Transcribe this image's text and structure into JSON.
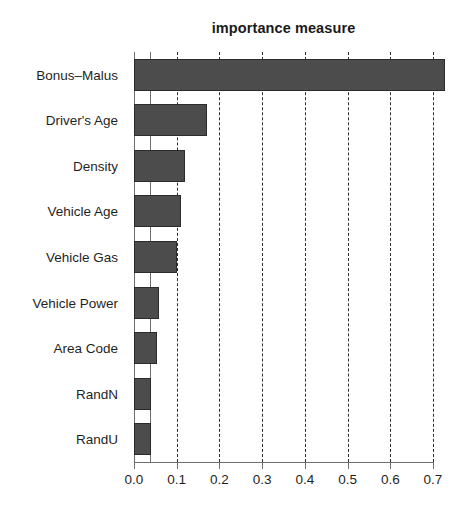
{
  "chart_data": {
    "type": "bar",
    "orientation": "horizontal",
    "title": "importance measure",
    "subtitle": "",
    "xlabel": "",
    "ylabel": "",
    "categories": [
      "Bonus–Malus",
      "Driver's Age",
      "Density",
      "Vehicle Age",
      "Vehicle Gas",
      "Vehicle Power",
      "Area Code",
      "RandN",
      "RandU"
    ],
    "values": [
      0.728,
      0.171,
      0.119,
      0.11,
      0.101,
      0.059,
      0.054,
      0.04,
      0.039
    ],
    "xlim": [
      0.0,
      0.7
    ],
    "xticks": [
      0.0,
      0.1,
      0.2,
      0.3,
      0.4,
      0.5,
      0.6,
      0.7
    ],
    "xtick_labels": [
      "0.0",
      "0.1",
      "0.2",
      "0.3",
      "0.4",
      "0.5",
      "0.6",
      "0.7"
    ],
    "grid": {
      "vertical": true,
      "horizontal": false,
      "style": "dashed",
      "color": "#2e2e2e"
    },
    "reference_line": {
      "value": 0.037,
      "style": "solid",
      "color": "#6e6e6e"
    },
    "legend": null,
    "bar_color": "#4c4c4c",
    "bar_border_color": "#2b2b2b",
    "background_color": "#ffffff",
    "text_color": "#1f1f1f"
  }
}
